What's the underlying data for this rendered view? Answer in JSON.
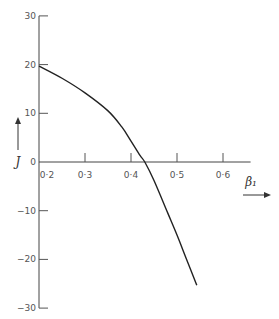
{
  "chart_data": {
    "type": "line",
    "title": "",
    "xlabel": "β₁",
    "ylabel": "J",
    "xlim": [
      0.2,
      0.65
    ],
    "ylim": [
      -30,
      30
    ],
    "x_ticks": [
      "0·2",
      "0·3",
      "0·4",
      "0·5",
      "0·6"
    ],
    "y_ticks": [
      "30",
      "20",
      "10",
      "0",
      "-10",
      "-20",
      "-30"
    ],
    "grid": false,
    "legend": null,
    "series": [
      {
        "name": "J vs β₁",
        "x": [
          0.2,
          0.25,
          0.3,
          0.35,
          0.38,
          0.4,
          0.42,
          0.43,
          0.45,
          0.48,
          0.5,
          0.52,
          0.543
        ],
        "y": [
          19.7,
          17.2,
          14.2,
          10.5,
          7.2,
          4.3,
          1.3,
          0.0,
          -3.8,
          -10.5,
          -15.0,
          -19.8,
          -25.3
        ]
      }
    ]
  }
}
